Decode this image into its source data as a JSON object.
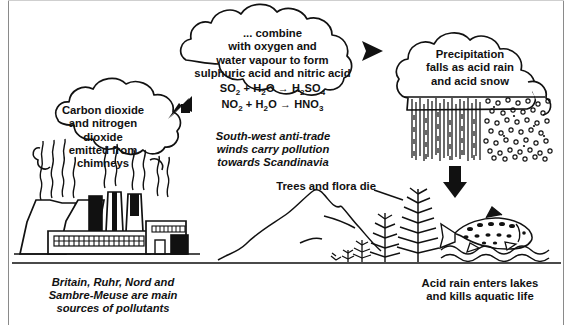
{
  "diagram": {
    "frame_color": "#8a8a8a",
    "ink_color": "#111111"
  },
  "clouds": {
    "source": {
      "name": "emission-cloud",
      "lines": [
        "Carbon dioxide",
        "and nitrogen",
        "dioxide",
        "emitted from",
        "chimneys"
      ]
    },
    "reaction": {
      "name": "reaction-cloud",
      "lines": [
        "... combine",
        "with oxygen and",
        "water vapour to form",
        "sulphuric acid and nitric acid"
      ],
      "equations": [
        "SO2 + H2O → H2SO4",
        "NO2 + H2O → HNO3"
      ]
    },
    "precipitation": {
      "name": "precipitation-cloud",
      "lines": [
        "Precipitation",
        "falls as acid rain",
        "and acid snow"
      ]
    }
  },
  "annotations": {
    "winds": [
      "South-west anti-trade",
      "winds carry pollution",
      "towards Scandinavia"
    ],
    "trees_label": "Trees and flora die",
    "source_caption": [
      "Britain, Ruhr, Nord and",
      "Sambre-Meuse are main",
      "sources of pollutants"
    ],
    "lake_caption": [
      "Acid rain enters lakes",
      "and kills aquatic life"
    ]
  },
  "arrows": [
    {
      "name": "arrow-emission-to-reaction",
      "direction": "up-right"
    },
    {
      "name": "arrow-reaction-to-precipitation",
      "direction": "right"
    },
    {
      "name": "arrow-precipitation-down",
      "direction": "down"
    }
  ],
  "scene_elements": [
    {
      "name": "power-station",
      "label": "cooling towers and chimneys"
    },
    {
      "name": "rain-hatching",
      "label": "acid rain"
    },
    {
      "name": "snow-dots",
      "label": "acid snow"
    },
    {
      "name": "mountain-range",
      "label": "mountains"
    },
    {
      "name": "dead-conifer-trees",
      "label": "dying trees"
    },
    {
      "name": "fish",
      "label": "aquatic life"
    },
    {
      "name": "lake-water",
      "label": "lake"
    }
  ]
}
